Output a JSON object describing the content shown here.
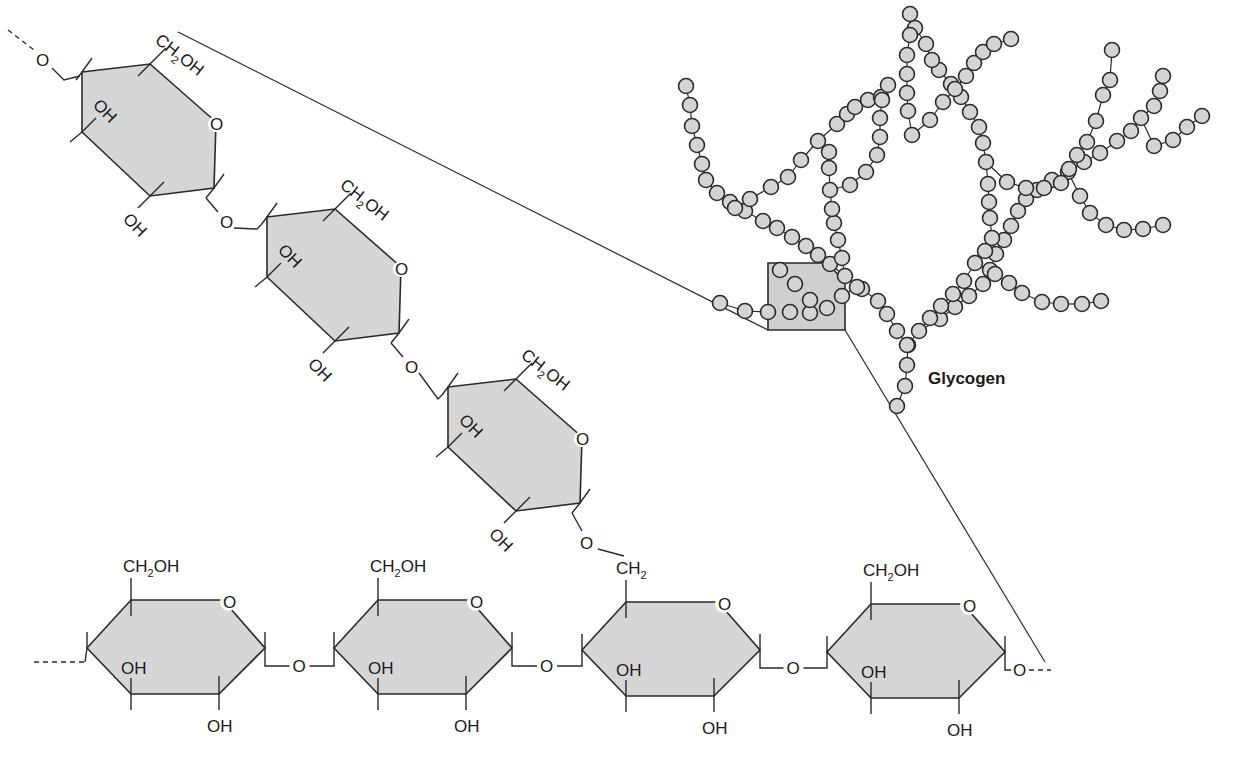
{
  "figure": {
    "title": "Glycogen",
    "title_pos": [
      928,
      384
    ],
    "colors": {
      "ring_fill": "#d6d6d6",
      "ball_fill": "#d4d4d4",
      "stroke": "#2a2a2a"
    }
  },
  "labels": {
    "ch2oh": "CH",
    "ch2oh_sub": "2",
    "ch2oh_tail": "OH",
    "oh": "OH",
    "o": "O",
    "ch2": "CH",
    "ch2_sub": "2"
  },
  "diagonal_rings": [
    {
      "id": "diag-1",
      "cx": 150,
      "cy": 130,
      "ch2oh_label": "CH2OH",
      "ring_o": "O",
      "oh_inner": "OH",
      "oh_lower": "OH"
    },
    {
      "id": "diag-2",
      "cx": 335,
      "cy": 275,
      "ch2oh_label": "CH2OH",
      "ring_o": "O",
      "oh_inner": "OH",
      "oh_lower": "OH"
    },
    {
      "id": "diag-3",
      "cx": 516,
      "cy": 445,
      "ch2oh_label": "CH2OH",
      "ring_o": "O",
      "oh_inner": "OH",
      "oh_lower": "OH"
    }
  ],
  "bottom_rings": [
    {
      "id": "bottom-1",
      "cx": 175,
      "cy": 648,
      "top_label": "CH2OH",
      "ring_o": "O",
      "oh_inner": "OH",
      "oh_lower": "OH"
    },
    {
      "id": "bottom-2",
      "cx": 422,
      "cy": 648,
      "top_label": "CH2OH",
      "ring_o": "O",
      "oh_inner": "OH",
      "oh_lower": "OH"
    },
    {
      "id": "bottom-3",
      "cx": 670,
      "cy": 650,
      "top_label": "CH2",
      "ring_o": "O",
      "oh_inner": "OH",
      "oh_lower": "OH"
    },
    {
      "id": "bottom-4",
      "cx": 915,
      "cy": 652,
      "top_label": "CH2OH",
      "ring_o": "O",
      "oh_inner": "OH",
      "oh_lower": "OH"
    }
  ],
  "glycosidic_links": [
    "O",
    "O",
    "O",
    "O",
    "O",
    "O",
    "O",
    "O"
  ],
  "zoom_box": {
    "points": "768,263 828,263 845,283 845,330 768,330"
  },
  "guide_lines": [
    {
      "x1": 178,
      "y1": 32,
      "x2": 768,
      "y2": 330
    },
    {
      "x1": 845,
      "y1": 330,
      "x2": 1045,
      "y2": 662
    }
  ],
  "glycogen_chains": [
    [
      [
        897,
        406
      ],
      [
        905,
        386
      ],
      [
        907,
        365
      ],
      [
        908,
        345
      ],
      [
        919,
        331
      ],
      [
        940,
        319
      ],
      [
        955,
        307
      ],
      [
        969,
        296
      ],
      [
        983,
        284
      ],
      [
        990,
        270
      ],
      [
        996,
        254
      ],
      [
        1004,
        240
      ],
      [
        1011,
        226
      ],
      [
        1018,
        211
      ],
      [
        1026,
        199
      ],
      [
        1037,
        190
      ],
      [
        1052,
        180
      ],
      [
        1068,
        172
      ],
      [
        1084,
        162
      ],
      [
        1100,
        153
      ],
      [
        1117,
        141
      ],
      [
        1131,
        131
      ],
      [
        1141,
        118
      ],
      [
        1154,
        106
      ]
    ],
    [
      [
        907,
        345
      ],
      [
        897,
        331
      ],
      [
        887,
        314
      ],
      [
        878,
        301
      ],
      [
        862,
        289
      ],
      [
        845,
        276
      ],
      [
        830,
        264
      ],
      [
        818,
        255
      ],
      [
        806,
        246
      ],
      [
        792,
        237
      ],
      [
        777,
        228
      ],
      [
        763,
        221
      ],
      [
        745,
        211
      ],
      [
        730,
        202
      ],
      [
        717,
        193
      ],
      [
        706,
        180
      ],
      [
        702,
        164
      ],
      [
        697,
        145
      ],
      [
        692,
        126
      ],
      [
        690,
        105
      ],
      [
        686,
        86
      ]
    ],
    [
      [
        735,
        208
      ],
      [
        750,
        199
      ],
      [
        771,
        187
      ],
      [
        788,
        177
      ],
      [
        801,
        160
      ],
      [
        818,
        141
      ],
      [
        837,
        124
      ],
      [
        847,
        114
      ],
      [
        855,
        107
      ],
      [
        868,
        100
      ],
      [
        881,
        97
      ],
      [
        888,
        85
      ]
    ],
    [
      [
        845,
        276
      ],
      [
        842,
        258
      ],
      [
        838,
        240
      ],
      [
        834,
        223
      ],
      [
        832,
        209
      ],
      [
        830,
        190
      ],
      [
        829,
        168
      ],
      [
        829,
        152
      ]
    ],
    [
      [
        830,
        190
      ],
      [
        850,
        185
      ],
      [
        866,
        172
      ],
      [
        877,
        155
      ],
      [
        880,
        137
      ],
      [
        880,
        118
      ],
      [
        882,
        100
      ]
    ],
    [
      [
        919,
        331
      ],
      [
        930,
        318
      ],
      [
        941,
        306
      ],
      [
        953,
        294
      ],
      [
        964,
        281
      ],
      [
        975,
        263
      ],
      [
        985,
        251
      ],
      [
        992,
        238
      ],
      [
        990,
        218
      ],
      [
        989,
        202
      ],
      [
        988,
        184
      ],
      [
        986,
        162
      ],
      [
        983,
        143
      ],
      [
        979,
        127
      ],
      [
        970,
        112
      ],
      [
        961,
        97
      ],
      [
        951,
        84
      ],
      [
        939,
        70
      ],
      [
        932,
        60
      ],
      [
        926,
        44
      ],
      [
        915,
        28
      ],
      [
        910,
        14
      ]
    ],
    [
      [
        975,
        263
      ],
      [
        995,
        274
      ],
      [
        1009,
        283
      ],
      [
        1022,
        293
      ],
      [
        1042,
        302
      ],
      [
        1061,
        304
      ],
      [
        1082,
        304
      ],
      [
        1101,
        301
      ]
    ],
    [
      [
        912,
        135
      ],
      [
        930,
        120
      ],
      [
        943,
        102
      ],
      [
        955,
        89
      ],
      [
        966,
        76
      ],
      [
        974,
        63
      ],
      [
        983,
        52
      ],
      [
        994,
        44
      ],
      [
        1011,
        39
      ]
    ],
    [
      [
        912,
        135
      ],
      [
        908,
        111
      ],
      [
        907,
        93
      ],
      [
        907,
        74
      ],
      [
        907,
        55
      ],
      [
        910,
        35
      ]
    ],
    [
      [
        986,
        162
      ],
      [
        1007,
        182
      ],
      [
        1026,
        188
      ],
      [
        1044,
        188
      ],
      [
        1061,
        183
      ],
      [
        1069,
        169
      ],
      [
        1077,
        155
      ],
      [
        1087,
        142
      ],
      [
        1096,
        121
      ],
      [
        1103,
        95
      ],
      [
        1110,
        80
      ],
      [
        1112,
        50
      ]
    ],
    [
      [
        1068,
        172
      ],
      [
        1080,
        196
      ],
      [
        1090,
        213
      ],
      [
        1106,
        225
      ],
      [
        1124,
        230
      ],
      [
        1143,
        229
      ],
      [
        1163,
        225
      ]
    ],
    [
      [
        1141,
        118
      ],
      [
        1154,
        146
      ],
      [
        1173,
        140
      ],
      [
        1187,
        127
      ],
      [
        1202,
        116
      ]
    ],
    [
      [
        1154,
        106
      ],
      [
        1160,
        91
      ],
      [
        1163,
        76
      ]
    ],
    [
      [
        720,
        303
      ],
      [
        745,
        311
      ],
      [
        768,
        312
      ],
      [
        790,
        312
      ],
      [
        810,
        313
      ],
      [
        827,
        308
      ],
      [
        842,
        296
      ],
      [
        857,
        287
      ]
    ],
    [
      [
        780,
        270
      ],
      [
        795,
        284
      ],
      [
        810,
        300
      ]
    ]
  ]
}
